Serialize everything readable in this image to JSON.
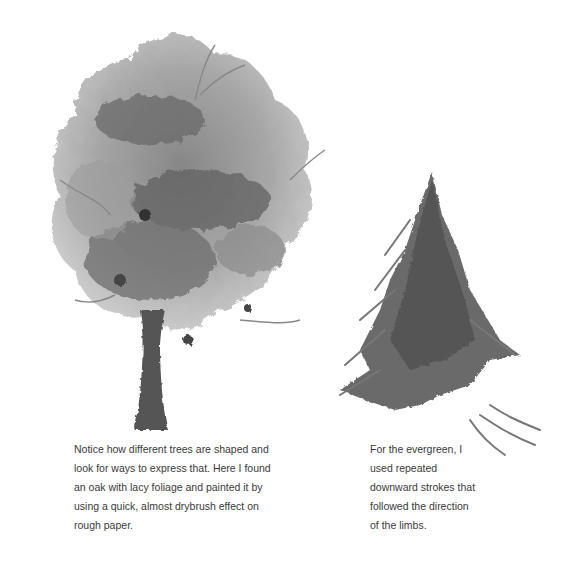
{
  "page": {
    "header_partial": "",
    "illustrations": [
      {
        "name": "oak-tree-watercolor",
        "description": "Watercolor oak tree with lacy foliage and dark trunk"
      },
      {
        "name": "evergreen-tree-watercolor",
        "description": "Watercolor evergreen tree painted with downward strokes"
      }
    ],
    "captions": {
      "oak": "Notice how different trees are shaped and look for ways to express that. Here I found an oak with lacy foliage and painted it by using a quick, almost drybrush effect on rough paper.",
      "evergreen": "For the evergreen, I used repeated downward strokes that followed the direction of the limbs."
    },
    "colors": {
      "ink": "#3a3a3a",
      "wash_light": "#b5b5b5",
      "wash_mid": "#8a8a8a",
      "wash_dark": "#4a4a4a"
    }
  }
}
